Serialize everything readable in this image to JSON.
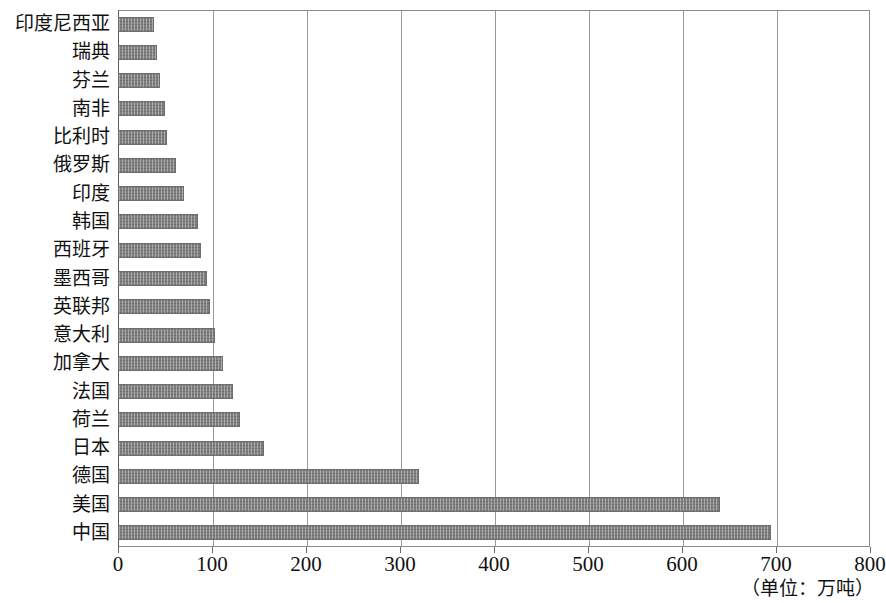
{
  "chart_data": {
    "type": "bar",
    "orientation": "horizontal",
    "title": "",
    "xlabel": "",
    "ylabel": "",
    "unit_note": "（单位：万吨）",
    "xlim": [
      0,
      800
    ],
    "xticks": [
      0,
      100,
      200,
      300,
      400,
      500,
      600,
      700,
      800
    ],
    "xtick_labels": [
      "0",
      "100",
      "200",
      "300",
      "400",
      "500",
      "600",
      "700",
      "800"
    ],
    "grid": true,
    "grid_axis": "x",
    "legend": "none",
    "bar_color": "#808080",
    "bar_edge_color": "#6e6e6e",
    "grid_color": "#9a9a9a",
    "categories": [
      "印度尼西亚",
      "瑞典",
      "芬兰",
      "南非",
      "比利时",
      "俄罗斯",
      "印度",
      "韩国",
      "西班牙",
      "墨西哥",
      "英联邦",
      "意大利",
      "加拿大",
      "法国",
      "荷兰",
      "日本",
      "德国",
      "美国",
      "中国"
    ],
    "values": [
      38,
      42,
      45,
      50,
      52,
      62,
      70,
      85,
      88,
      95,
      98,
      103,
      112,
      122,
      130,
      155,
      320,
      640,
      695
    ]
  }
}
